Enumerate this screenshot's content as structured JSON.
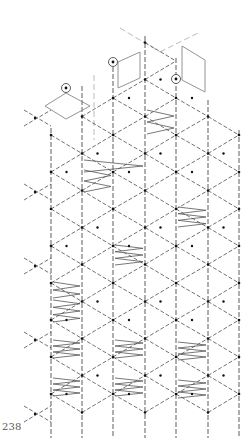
{
  "page": {
    "number": "238"
  },
  "colors": {
    "line": "#333333",
    "dot": "#111111",
    "thread": "#555555",
    "shape": "#888888",
    "faint": "#bbbbbb"
  },
  "lattice": {
    "columns_x": [
      51,
      82,
      113,
      145,
      176,
      208,
      239
    ],
    "column_top_y": [
      128,
      86,
      60,
      36,
      58,
      100,
      130
    ],
    "column_bottom_y": 438,
    "dot_spacing_y": 37,
    "center_offset_y": 18.5
  },
  "zigzags": [
    {
      "x1": 145,
      "x2": 176,
      "y": 110,
      "h": 24,
      "zigs": 2
    },
    {
      "x1": 82,
      "x2": 145,
      "y": 160,
      "h": 12,
      "zigs": 1
    },
    {
      "x1": 82,
      "x2": 113,
      "y": 170,
      "h": 22,
      "zigs": 2
    },
    {
      "x1": 176,
      "x2": 208,
      "y": 207,
      "h": 20,
      "zigs": 3
    },
    {
      "x1": 113,
      "x2": 145,
      "y": 245,
      "h": 20,
      "zigs": 3
    },
    {
      "x1": 51,
      "x2": 82,
      "y": 282,
      "h": 16,
      "zigs": 2
    },
    {
      "x1": 51,
      "x2": 82,
      "y": 300,
      "h": 22,
      "zigs": 3
    },
    {
      "x1": 51,
      "x2": 82,
      "y": 340,
      "h": 18,
      "zigs": 3
    },
    {
      "x1": 113,
      "x2": 145,
      "y": 340,
      "h": 18,
      "zigs": 3
    },
    {
      "x1": 176,
      "x2": 208,
      "y": 342,
      "h": 18,
      "zigs": 3
    },
    {
      "x1": 51,
      "x2": 82,
      "y": 378,
      "h": 18,
      "zigs": 3
    },
    {
      "x1": 113,
      "x2": 145,
      "y": 378,
      "h": 18,
      "zigs": 3
    },
    {
      "x1": 176,
      "x2": 208,
      "y": 380,
      "h": 18,
      "zigs": 3
    }
  ],
  "circled_pins": [
    {
      "x": 66,
      "y": 88
    },
    {
      "x": 113,
      "y": 62
    },
    {
      "x": 176,
      "y": 79
    }
  ],
  "diamonds": [
    {
      "points": "45,106 66,93 90,106 66,119"
    },
    {
      "points": "118,62 140,52 140,78 118,88"
    },
    {
      "points": "182,46 205,60 205,92 182,80"
    }
  ],
  "faint_lines": [
    {
      "x1": 120,
      "y1": 28,
      "x2": 160,
      "y2": 52
    },
    {
      "x1": 160,
      "y1": 52,
      "x2": 200,
      "y2": 32
    },
    {
      "x1": 94,
      "y1": 75,
      "x2": 94,
      "y2": 140
    }
  ]
}
